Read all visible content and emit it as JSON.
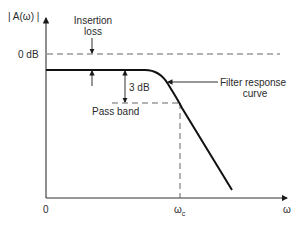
{
  "diagram": {
    "type": "filter-frequency-response",
    "y_axis_label": "| A(ω) |",
    "x_axis_label": "ω",
    "origin_label": "0",
    "zero_db_label": "0 dB",
    "cutoff_label": "ω",
    "cutoff_subscript": "c",
    "annotations": {
      "insertion_loss_line1": "Insertion",
      "insertion_loss_line2": "loss",
      "three_db": "3 dB",
      "pass_band": "Pass band",
      "filter_response_line1": "Filter response",
      "filter_response_line2": "curve"
    },
    "colors": {
      "line": "#1a1a1a",
      "dashed": "#555555",
      "background": "#ffffff"
    }
  }
}
